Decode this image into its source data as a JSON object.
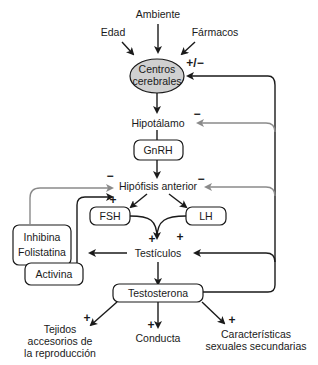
{
  "inputs": {
    "ambiente": "Ambiente",
    "edad": "Edad",
    "farmacos": "Fármacos"
  },
  "nodes": {
    "centros_line1": "Centros",
    "centros_line2": "cerebrales",
    "hipotalamo": "Hipotálamo",
    "gnrh": "GnRH",
    "hipofisis": "Hipófisis anterior",
    "fsh": "FSH",
    "lh": "LH",
    "inhibina_line1": "Inhibina",
    "inhibina_line2": "Folistatina",
    "activina": "Activina",
    "testiculos": "Testículos",
    "testosterona": "Testosterona"
  },
  "outputs": {
    "tejidos_line1": "Tejidos",
    "tejidos_line2": "accesorios de",
    "tejidos_line3": "la reproducción",
    "conducta": "Conducta",
    "caracteristicas_line1": "Características",
    "caracteristicas_line2": "sexuales secundarias"
  },
  "signs": {
    "centros_feedback": "+/−",
    "hipotalamo_feedback": "−",
    "hipofisis_right_feedback": "−",
    "hipofisis_left_inhibina": "−",
    "hipofisis_left_activina": "+",
    "testiculos_fsh": "+",
    "testiculos_lh": "+",
    "testiculos_right": "+",
    "tejidos": "+",
    "conducta": "+",
    "caracteristicas": "+"
  },
  "colors": {
    "positive_line": "#1a1a1a",
    "negative_line": "#8a8a8a",
    "ellipse_fill": "#d0d0d0"
  }
}
